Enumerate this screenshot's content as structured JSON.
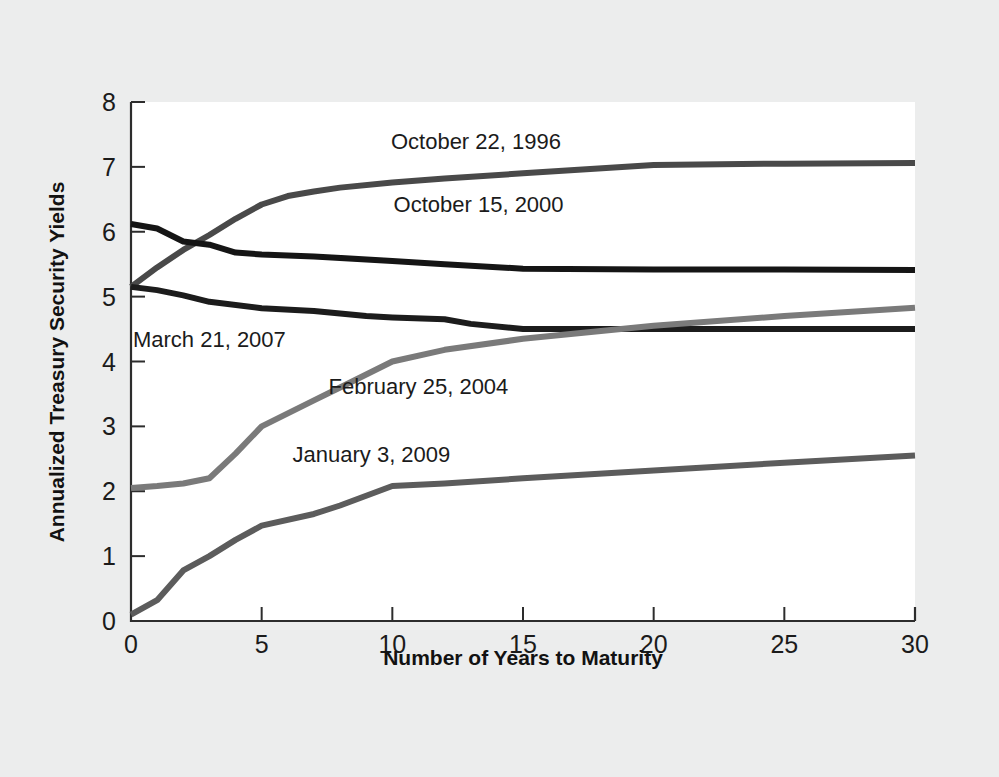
{
  "chart_data": {
    "type": "line",
    "title": "",
    "xlabel": "Number of Years to Maturity",
    "ylabel": "Annualized Treasury Security Yields",
    "xlim": [
      0,
      30
    ],
    "ylim": [
      0,
      8
    ],
    "xticks": [
      0,
      5,
      10,
      15,
      20,
      25,
      30
    ],
    "yticks": [
      0,
      1,
      2,
      3,
      4,
      5,
      6,
      7,
      8
    ],
    "xtick_labels": [
      "0",
      "5",
      "10",
      "15",
      "20",
      "25",
      "30"
    ],
    "ytick_labels": [
      "0",
      "1",
      "2",
      "3",
      "4",
      "5",
      "6",
      "7",
      "8"
    ],
    "grid": false,
    "legend": "inline-labels",
    "series": [
      {
        "name": "October 22, 1996",
        "color": "#494949",
        "label_x": 13.2,
        "label_y": 7.28,
        "x": [
          0,
          1,
          2,
          3,
          4,
          5,
          6,
          7,
          8,
          10,
          12,
          15,
          20,
          25,
          30
        ],
        "y": [
          5.15,
          5.45,
          5.72,
          5.95,
          6.2,
          6.42,
          6.55,
          6.62,
          6.68,
          6.76,
          6.82,
          6.9,
          7.03,
          7.05,
          7.06
        ]
      },
      {
        "name": "October 15, 2000",
        "color": "#151515",
        "label_x": 13.3,
        "label_y": 6.3,
        "x": [
          0,
          1,
          2,
          3,
          4,
          5,
          7,
          10,
          12,
          15,
          20,
          25,
          30
        ],
        "y": [
          6.12,
          6.05,
          5.85,
          5.8,
          5.68,
          5.65,
          5.62,
          5.55,
          5.5,
          5.43,
          5.42,
          5.42,
          5.41
        ]
      },
      {
        "name": "March 21, 2007",
        "color": "#1c1c1c",
        "label_x": 3.0,
        "label_y": 4.22,
        "x": [
          0,
          1,
          2,
          3,
          5,
          7,
          9,
          10,
          12,
          13,
          15,
          20,
          25,
          30
        ],
        "y": [
          5.15,
          5.1,
          5.02,
          4.92,
          4.82,
          4.78,
          4.7,
          4.68,
          4.65,
          4.58,
          4.5,
          4.5,
          4.5,
          4.5
        ]
      },
      {
        "name": "February 25, 2004",
        "color": "#7a7a7a",
        "label_x": 11.0,
        "label_y": 3.5,
        "x": [
          0,
          1,
          2,
          3,
          4,
          5,
          7,
          8,
          10,
          12,
          15,
          20,
          25,
          30
        ],
        "y": [
          2.05,
          2.08,
          2.12,
          2.2,
          2.58,
          3.0,
          3.4,
          3.6,
          4.0,
          4.18,
          4.35,
          4.55,
          4.7,
          4.83
        ]
      },
      {
        "name": "January 3, 2009",
        "color": "#5c5c5c",
        "label_x": 9.2,
        "label_y": 2.45,
        "x": [
          0,
          1,
          2,
          3,
          4,
          5,
          7,
          8,
          10,
          12,
          15,
          20,
          25,
          30
        ],
        "y": [
          0.1,
          0.32,
          0.78,
          1.0,
          1.25,
          1.47,
          1.65,
          1.78,
          2.08,
          2.12,
          2.2,
          2.32,
          2.44,
          2.55
        ]
      }
    ]
  }
}
